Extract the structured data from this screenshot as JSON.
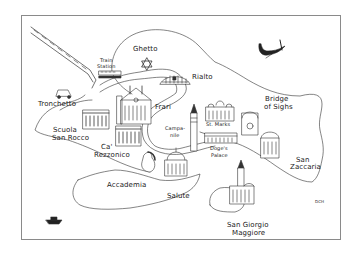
{
  "map": {
    "title": "Venice",
    "style": "hand-drawn line illustration",
    "colors": {
      "ink": "#222222",
      "paper": "#ffffff",
      "frame": "#8a8a8a"
    },
    "labels": [
      {
        "id": "ghetto",
        "text": "Ghetto"
      },
      {
        "id": "train_station_1",
        "text": "Train"
      },
      {
        "id": "train_station_2",
        "text": "Station"
      },
      {
        "id": "rialto",
        "text": "Rialto"
      },
      {
        "id": "tronchetto",
        "text": "Tronchetto"
      },
      {
        "id": "frari",
        "text": "Frari"
      },
      {
        "id": "scuola_1",
        "text": "Scuola"
      },
      {
        "id": "scuola_2",
        "text": "San Rocco"
      },
      {
        "id": "ca_1",
        "text": "Ca'"
      },
      {
        "id": "ca_2",
        "text": "Rezzonico"
      },
      {
        "id": "campanile_1",
        "text": "Campa-"
      },
      {
        "id": "campanile_2",
        "text": "nile"
      },
      {
        "id": "st_marks",
        "text": "St. Marks"
      },
      {
        "id": "bridge_1",
        "text": "Bridge"
      },
      {
        "id": "bridge_2",
        "text": "of Sighs"
      },
      {
        "id": "doges_1",
        "text": "Doge's"
      },
      {
        "id": "doges_2",
        "text": "Palace"
      },
      {
        "id": "accademia",
        "text": "Accademia"
      },
      {
        "id": "salute",
        "text": "Salute"
      },
      {
        "id": "zaccaria_1",
        "text": "San"
      },
      {
        "id": "zaccaria_2",
        "text": "Zaccaria"
      },
      {
        "id": "giorgio_1",
        "text": "San Giorgio"
      },
      {
        "id": "giorgio_2",
        "text": "Maggiore"
      },
      {
        "id": "signature",
        "text": "DCH"
      }
    ],
    "icons": [
      "railway-causeway-icon",
      "star-of-david-icon",
      "train-icon",
      "rialto-bridge-icon",
      "car-icon",
      "frari-church-icon",
      "scuola-building-icon",
      "ca-rezzonico-building-icon",
      "campanile-tower-icon",
      "st-marks-basilica-icon",
      "bridge-of-sighs-icon",
      "doges-palace-icon",
      "salute-church-icon",
      "san-zaccaria-church-icon",
      "san-giorgio-church-icon",
      "gondola-icon",
      "boat-icon",
      "woman-figure-icon"
    ]
  }
}
